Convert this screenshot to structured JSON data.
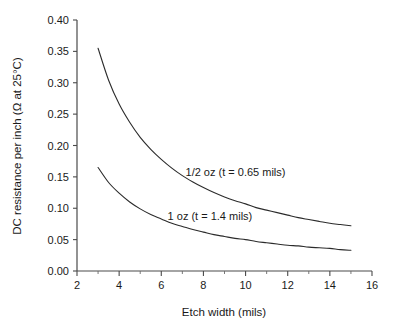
{
  "chart_data": {
    "type": "line",
    "title": "",
    "xlabel": "Etch width (mils)",
    "ylabel": "DC resistance per inch (Ω at 25°C)",
    "xlim": [
      2,
      16
    ],
    "ylim": [
      0.0,
      0.4
    ],
    "grid": false,
    "legend_position": "inline-annotation",
    "xticks": [
      2,
      4,
      6,
      8,
      10,
      12,
      14,
      16
    ],
    "xtick_labels": [
      "2",
      "4",
      "6",
      "8",
      "10",
      "12",
      "14",
      "16"
    ],
    "xminor_ticks": [
      3,
      5,
      7,
      9,
      11,
      13,
      15
    ],
    "yticks": [
      0.0,
      0.05,
      0.1,
      0.15,
      0.2,
      0.25,
      0.3,
      0.35,
      0.4
    ],
    "ytick_labels": [
      "0.00",
      "0.05",
      "0.10",
      "0.15",
      "0.20",
      "0.25",
      "0.30",
      "0.35",
      "0.40"
    ],
    "x": [
      3,
      3.5,
      4,
      4.5,
      5,
      5.5,
      6,
      6.5,
      7,
      7.5,
      8,
      8.5,
      9,
      9.5,
      10,
      10.5,
      11,
      11.5,
      12,
      12.5,
      13,
      13.5,
      14,
      14.5,
      15
    ],
    "series": [
      {
        "name": "1/2 oz (t = 0.65 mils)",
        "label": "1/2 oz (t = 0.65 mils)",
        "color": "#2b2b2b",
        "label_x": 7.15,
        "label_y": 0.158,
        "values": [
          0.355,
          0.304,
          0.266,
          0.237,
          0.213,
          0.194,
          0.178,
          0.164,
          0.152,
          0.142,
          0.133,
          0.125,
          0.118,
          0.112,
          0.107,
          0.101,
          0.097,
          0.093,
          0.089,
          0.085,
          0.082,
          0.079,
          0.076,
          0.074,
          0.072
        ]
      },
      {
        "name": "1 oz (t = 1.4 mils)",
        "label": "1 oz (t = 1.4 mils)",
        "color": "#2b2b2b",
        "label_x": 6.3,
        "label_y": 0.088,
        "values": [
          0.165,
          0.141,
          0.124,
          0.11,
          0.099,
          0.09,
          0.083,
          0.076,
          0.071,
          0.066,
          0.062,
          0.058,
          0.055,
          0.052,
          0.05,
          0.047,
          0.045,
          0.043,
          0.041,
          0.04,
          0.038,
          0.037,
          0.036,
          0.034,
          0.033
        ]
      }
    ]
  }
}
